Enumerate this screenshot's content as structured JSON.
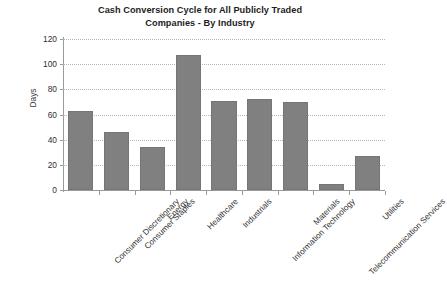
{
  "chart_data": {
    "type": "bar",
    "title": "Cash Conversion Cycle for All Publicly Traded Companies - By Industry",
    "title_lines": [
      "Cash Conversion Cycle for All Publicly Traded",
      "Companies - By Industry"
    ],
    "xlabel": "",
    "ylabel": "Days",
    "ylim": [
      0,
      120
    ],
    "ytick_values": [
      0,
      20,
      40,
      60,
      80,
      100,
      120
    ],
    "ytick_labels": [
      "0",
      "20",
      "40",
      "60",
      "80",
      "100",
      "120"
    ],
    "grid": "horizontal-dotted",
    "legend": "none",
    "bar_color": "#808080",
    "categories": [
      "Consumer Discretionary",
      "Consumer Staples",
      "Energy",
      "Healthcare",
      "Industrials",
      "Information Technology",
      "Materials",
      "Telecommunication Services",
      "Utilities"
    ],
    "values": [
      63,
      46,
      34,
      107,
      71,
      72,
      70,
      5,
      27
    ]
  }
}
